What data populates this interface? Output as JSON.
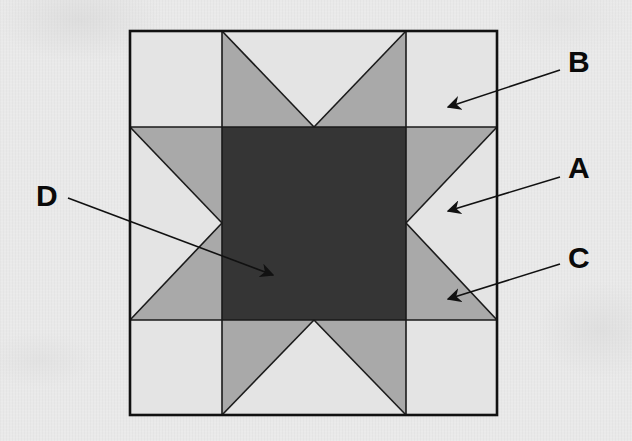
{
  "diagram": {
    "type": "quilt-block",
    "colors": {
      "background": "#e9e9e9",
      "light": "#e4e4e4",
      "medium": "#a9a9a9",
      "dark": "#353535",
      "outline": "#1a1a1a"
    },
    "labels": [
      {
        "id": "B",
        "text": "B",
        "points_to": "corner square (light)"
      },
      {
        "id": "A",
        "text": "A",
        "points_to": "side triangle background (light)"
      },
      {
        "id": "C",
        "text": "C",
        "points_to": "star point triangle (medium gray)"
      },
      {
        "id": "D",
        "text": "D",
        "points_to": "center square (dark)"
      }
    ]
  }
}
